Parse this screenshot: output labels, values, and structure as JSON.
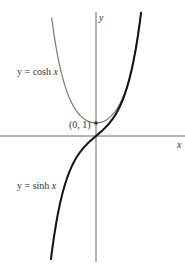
{
  "chart_data": {
    "type": "line",
    "title": "",
    "xlabel": "x",
    "ylabel": "y",
    "series": [
      {
        "name": "y = cosh x",
        "function": "cosh",
        "color": "#777777",
        "x_range": [
          -2.9,
          2.95
        ]
      },
      {
        "name": "y = sinh x",
        "function": "sinh",
        "color": "#111111",
        "x_range": [
          -2.95,
          2.95
        ]
      }
    ],
    "annotations": [
      {
        "text": "(0, 1)",
        "x": 0,
        "y": 1
      }
    ],
    "grid": false,
    "legend": "inline labels"
  },
  "labels": {
    "y_axis": "y",
    "x_axis": "x",
    "cosh_label_prefix": "y = cosh ",
    "cosh_label_var": "x",
    "sinh_label_prefix": "y = sinh ",
    "sinh_label_var": "x",
    "point": "(0, 1)"
  }
}
